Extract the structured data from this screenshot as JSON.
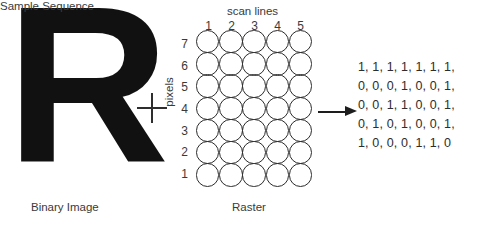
{
  "figure": {
    "background_color": "#ffffff",
    "ink_color": "#2d2d2d"
  },
  "binary_image": {
    "glyph": "R",
    "caption": "Binary Image"
  },
  "operator": {
    "plus": "+"
  },
  "raster": {
    "caption": "Raster",
    "x_axis_title": "scan lines",
    "y_axis_title": "pixels",
    "column_labels": [
      "1",
      "2",
      "3",
      "4",
      "5"
    ],
    "row_labels": [
      "7",
      "6",
      "5",
      "4",
      "3",
      "2",
      "1"
    ],
    "columns": 5,
    "rows": 7,
    "cell_shape": "circle"
  },
  "arrow": {
    "name": "right-arrow",
    "direction": "right"
  },
  "sample_sequence": {
    "caption": "Sample Sequence",
    "lines": [
      "1, 1, 1, 1, 1, 1, 1,",
      "0, 0, 0, 1, 0, 0, 1,",
      "0, 0, 1, 1, 0, 0, 1,",
      "0, 1, 0, 1, 0, 0, 1,",
      "1, 0, 0, 0, 1, 1, 0"
    ]
  }
}
